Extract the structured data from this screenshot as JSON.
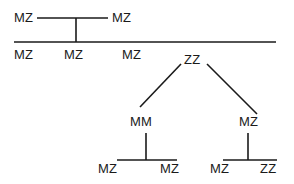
{
  "diagram": {
    "type": "pedigree",
    "nodes": {
      "parent_left": "MZ",
      "parent_right": "MZ",
      "child_1": "MZ",
      "child_2": "MZ",
      "child_3": "MZ",
      "child_4": "ZZ",
      "gc_left": "MM",
      "gc_right": "MZ",
      "ggc_1": "MZ",
      "ggc_2": "MZ",
      "ggc_3": "MZ",
      "ggc_4": "ZZ"
    },
    "colors": {
      "line": "#1a1a1a",
      "background": "#ffffff"
    }
  }
}
